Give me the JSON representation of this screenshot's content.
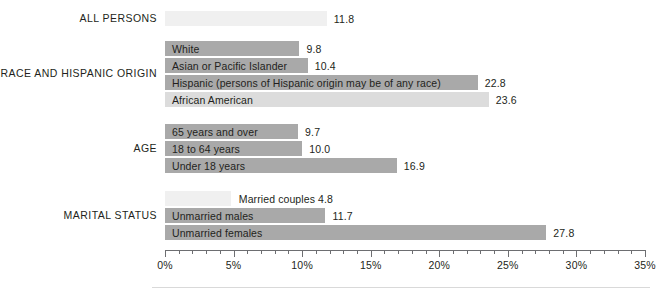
{
  "chart_data": {
    "type": "bar",
    "orientation": "horizontal",
    "title": "",
    "xlabel": "",
    "ylabel": "",
    "xlim": [
      0,
      35
    ],
    "xtick_labels": [
      "0%",
      "5%",
      "10%",
      "15%",
      "20%",
      "25%",
      "30%",
      "35%"
    ],
    "xticks": [
      0,
      5,
      10,
      15,
      20,
      25,
      30,
      35
    ],
    "xtick_minor_interval": 1,
    "grid": false,
    "legend": false,
    "value_suffix": "%",
    "groups": [
      {
        "name": "ALL PERSONS",
        "bars": [
          {
            "label": "",
            "value": 11.8,
            "value_text": "11.8",
            "color": "#f0f0f0",
            "label_inside": false
          }
        ]
      },
      {
        "name": "RACE AND HISPANIC ORIGIN",
        "bars": [
          {
            "label": "White",
            "value": 9.8,
            "value_text": "9.8",
            "color": "#a9a9a9",
            "label_inside": true
          },
          {
            "label": "Asian or Pacific Islander",
            "value": 10.4,
            "value_text": "10.4",
            "color": "#a9a9a9",
            "label_inside": true
          },
          {
            "label": "Hispanic (persons of Hispanic origin may be of any race)",
            "value": 22.8,
            "value_text": "22.8",
            "color": "#a9a9a9",
            "label_inside": true
          },
          {
            "label": "African American",
            "value": 23.6,
            "value_text": "23.6",
            "color": "#dcdcdc",
            "label_inside": true
          }
        ]
      },
      {
        "name": "AGE",
        "bars": [
          {
            "label": "65 years and over",
            "value": 9.7,
            "value_text": "9.7",
            "color": "#a9a9a9",
            "label_inside": true
          },
          {
            "label": "18 to 64 years",
            "value": 10.0,
            "value_text": "10.0",
            "color": "#a9a9a9",
            "label_inside": true
          },
          {
            "label": "Under 18 years",
            "value": 16.9,
            "value_text": "16.9",
            "color": "#a9a9a9",
            "label_inside": true
          }
        ]
      },
      {
        "name": "MARITAL STATUS",
        "bars": [
          {
            "label": "Married couples 4.8",
            "value": 4.8,
            "value_text": "",
            "color": "#f0f0f0",
            "label_inside": false
          },
          {
            "label": "Unmarried males",
            "value": 11.7,
            "value_text": "11.7",
            "color": "#a9a9a9",
            "label_inside": true
          },
          {
            "label": "Unmarried females",
            "value": 27.8,
            "value_text": "27.8",
            "color": "#a9a9a9",
            "label_inside": true
          }
        ]
      }
    ]
  }
}
